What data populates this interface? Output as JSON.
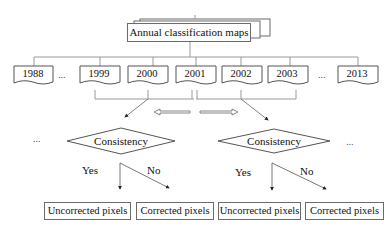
{
  "diagram": {
    "title_box": "Annual classification maps",
    "years": [
      "1988",
      "1999",
      "2000",
      "2001",
      "2002",
      "2003",
      "2013"
    ],
    "ellipsis": "...",
    "decisions": [
      {
        "label": "Consistency",
        "yes": "Yes",
        "no": "No"
      },
      {
        "label": "Consistency",
        "yes": "Yes",
        "no": "No"
      }
    ],
    "results": [
      "Uncorrected pixels",
      "Corrected pixels",
      "Uncorrected pixels",
      "Corrected pixels"
    ]
  }
}
